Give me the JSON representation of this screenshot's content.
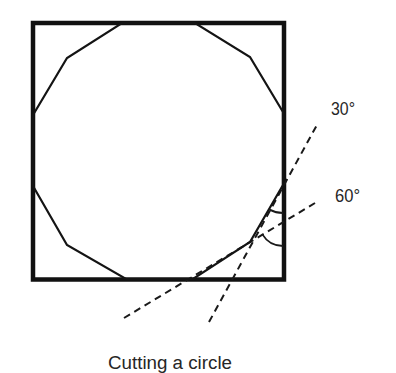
{
  "diagram": {
    "caption": "Cutting a circle",
    "angle_labels": {
      "upper": "30°",
      "lower": "60°"
    },
    "elements": {
      "square": "outer square frame",
      "polygon": "12-sided polygon inscribed in square",
      "cut_lines": [
        {
          "label": "30°",
          "style": "dashed"
        },
        {
          "label": "60°",
          "style": "dashed"
        }
      ]
    },
    "colors": {
      "stroke": "#111111",
      "text": "#262626",
      "background": "#ffffff"
    }
  }
}
